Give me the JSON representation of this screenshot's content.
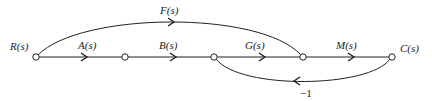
{
  "diagram": {
    "type": "signal-flow-graph",
    "nodes": [
      {
        "id": "n1",
        "label": "R(s)"
      },
      {
        "id": "n2",
        "label": ""
      },
      {
        "id": "n3",
        "label": ""
      },
      {
        "id": "n4",
        "label": ""
      },
      {
        "id": "n5",
        "label": "C(s)"
      }
    ],
    "branches": [
      {
        "from": "n1",
        "to": "n2",
        "gain": "A(s)"
      },
      {
        "from": "n2",
        "to": "n3",
        "gain": "B(s)"
      },
      {
        "from": "n3",
        "to": "n4",
        "gain": "G(s)"
      },
      {
        "from": "n4",
        "to": "n5",
        "gain": "M(s)"
      },
      {
        "from": "n1",
        "to": "n4",
        "gain": "F(s)"
      },
      {
        "from": "n5",
        "to": "n3",
        "gain": "−1"
      }
    ]
  }
}
